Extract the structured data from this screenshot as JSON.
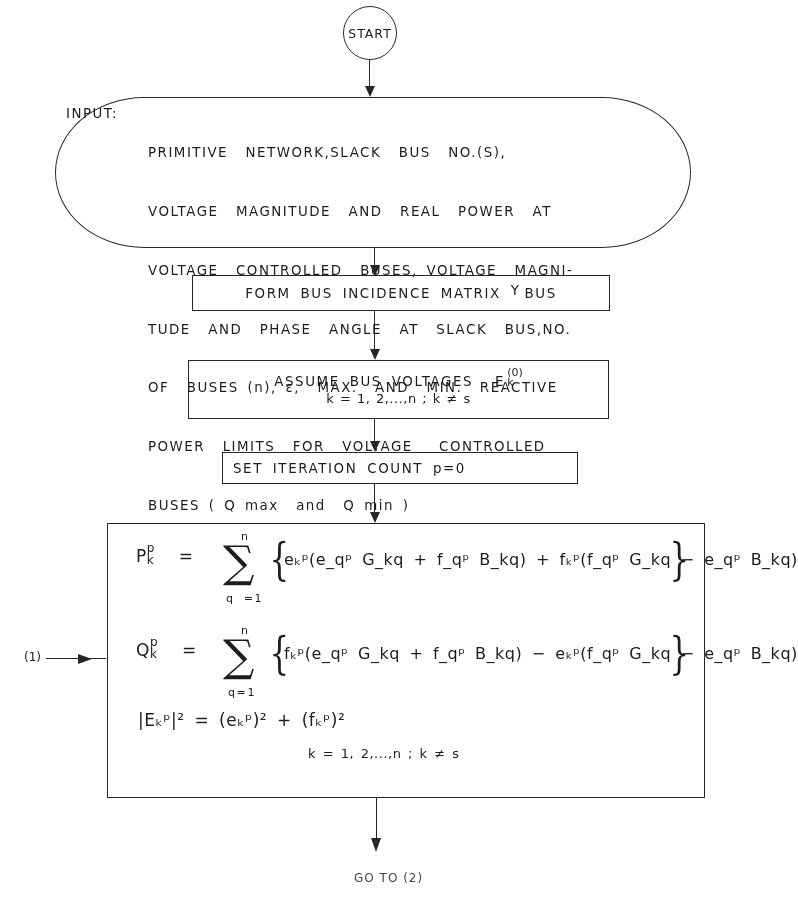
{
  "flowchart": {
    "start": {
      "label": "START"
    },
    "input": {
      "label": "INPUT:",
      "lines": [
        "PRIMITIVE  NETWORK,SLACK  BUS  NO.(S),",
        "VOLTAGE  MAGNITUDE  AND  REAL  POWER  AT",
        "VOLTAGE  CONTROLLED  BUSES, VOLTAGE  MAGNI-",
        "TUDE  AND  PHASE  ANGLE  AT  SLACK  BUS,NO.",
        "OF  BUSES (n), ε,  MAX.  AND  MIN.  REACTIVE",
        "POWER  LIMITS  FOR  VOLTAGE   CONTROLLED",
        "BUSES ( Q max  and  Q min )"
      ]
    },
    "form_ybus": {
      "text": "FORM  BUS  INCIDENCE  MATRIX",
      "y": "Y",
      "bus": "BUS"
    },
    "assume_voltages": {
      "text": "ASSUME  BUS  VOLTAGES",
      "symbol": "E",
      "superscript": "(0)",
      "subscript": "k",
      "condition": "k = 1, 2,...,n ; k ≠ s"
    },
    "set_iteration": {
      "text": "SET  ITERATION  COUNT  p=0"
    },
    "equations_block": {
      "connector_label": "(1)",
      "p_equation": {
        "lhs": "P",
        "lhs_sup": "p",
        "lhs_sub": "k",
        "sum_upper": "n",
        "sum_lower": "q =1",
        "rhs": "eₖᵖ(e_qᵖ G_kq + f_qᵖ B_kq) + fₖᵖ(f_qᵖ G_kq − e_qᵖ B_kq)"
      },
      "q_equation": {
        "lhs": "Q",
        "lhs_sup": "p",
        "lhs_sub": "k",
        "sum_upper": "n",
        "sum_lower": "q=1",
        "rhs": "fₖᵖ(e_qᵖ G_kq + f_qᵖ B_kq) − eₖᵖ(f_qᵖ G_kq − e_qᵖ B_kq)"
      },
      "magnitude_equation": "|Eₖᵖ|² = (eₖᵖ)² + (fₖᵖ)²",
      "condition": "k = 1, 2,...,n ; k ≠ s"
    },
    "goto": {
      "label": "GO TO (2)"
    }
  }
}
